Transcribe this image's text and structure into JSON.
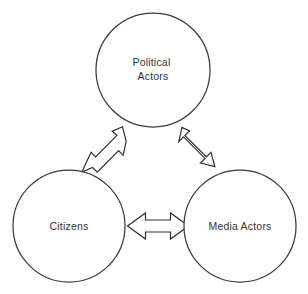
{
  "diagram": {
    "background_color": "#ffffff",
    "stroke_color": "#333333",
    "text_color": "#333333",
    "nodes": [
      {
        "id": "political-actors",
        "label_line1": "Political",
        "label_line2": "Actors",
        "label_full": "Political Actors",
        "cx": 153,
        "cy": 70,
        "r": 57
      },
      {
        "id": "citizens",
        "label_line1": "Citizens",
        "label_line2": "",
        "label_full": "Citizens",
        "cx": 69,
        "cy": 226,
        "r": 56
      },
      {
        "id": "media-actors",
        "label_line1": "Media Actors",
        "label_line2": "",
        "label_full": "Media Actors",
        "cx": 240,
        "cy": 226,
        "r": 56
      }
    ],
    "connectors": [
      {
        "id": "citizens-political",
        "from": "citizens",
        "to": "political-actors",
        "style": "double-headed-arrow",
        "orientation": "diagonal-up-right"
      },
      {
        "id": "political-media",
        "from": "political-actors",
        "to": "media-actors",
        "style": "double-headed-arrow",
        "orientation": "diagonal-down-right"
      },
      {
        "id": "citizens-media",
        "from": "citizens",
        "to": "media-actors",
        "style": "double-headed-arrow",
        "orientation": "horizontal"
      }
    ]
  }
}
